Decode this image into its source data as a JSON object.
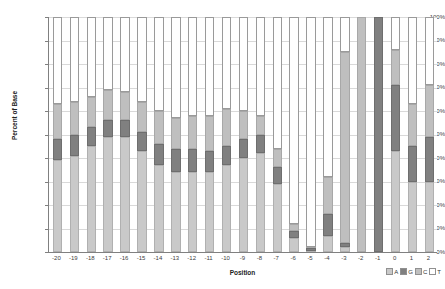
{
  "chart_data": {
    "type": "bar",
    "subtype": "stacked-100-percent",
    "title": "",
    "xlabel": "Position",
    "ylabel": "Percent of Base",
    "ylim": [
      0,
      100
    ],
    "ytick_labels": [
      "100%",
      "90%",
      "80%",
      "70%",
      "60%",
      "50%",
      "40%",
      "30%",
      "20%",
      "10%",
      "0%"
    ],
    "ytick_values": [
      100,
      90,
      80,
      70,
      60,
      50,
      40,
      30,
      20,
      10,
      0
    ],
    "grid": true,
    "legend_position": "bottom-right",
    "stack_order": [
      "A",
      "G",
      "C",
      "T"
    ],
    "categories": [
      "-20",
      "-19",
      "-18",
      "-17",
      "-16",
      "-15",
      "-14",
      "-13",
      "-12",
      "-11",
      "-10",
      "-9",
      "-8",
      "-7",
      "-6",
      "-5",
      "-4",
      "-3",
      "-2",
      "-1",
      "0",
      "1",
      "2"
    ],
    "series": [
      {
        "name": "A",
        "color": "#c9c9c9",
        "values": [
          39,
          41,
          45,
          49,
          49,
          43,
          37,
          34,
          34,
          34,
          37,
          40,
          42,
          29,
          6,
          0.5,
          7,
          2,
          0,
          0,
          43,
          30,
          30
        ]
      },
      {
        "name": "G",
        "color": "#808080",
        "values": [
          9,
          9,
          8,
          7,
          7,
          8,
          9,
          10,
          10,
          9,
          8,
          8,
          8,
          7,
          3,
          1,
          9,
          2,
          0,
          100,
          28,
          15,
          19
        ]
      },
      {
        "name": "C",
        "color": "#bfbfbf",
        "values": [
          15,
          14,
          13,
          13,
          12,
          13,
          14,
          13,
          14,
          15,
          16,
          12,
          8,
          8,
          3,
          0.5,
          16,
          81,
          100,
          0,
          15,
          18,
          22
        ]
      },
      {
        "name": "T",
        "color": "#ffffff",
        "values": [
          37,
          36,
          34,
          31,
          32,
          36,
          40,
          43,
          42,
          42,
          39,
          40,
          42,
          56,
          88,
          98,
          68,
          15,
          0,
          0,
          14,
          37,
          29
        ]
      }
    ]
  },
  "legend": {
    "items": [
      {
        "label": "A",
        "color": "#c9c9c9"
      },
      {
        "label": "G",
        "color": "#808080"
      },
      {
        "label": "C",
        "color": "#bfbfbf"
      },
      {
        "label": "T",
        "color": "#ffffff"
      }
    ]
  }
}
